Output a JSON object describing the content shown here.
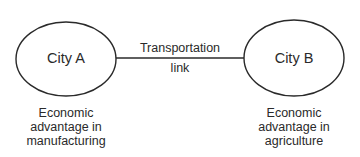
{
  "diagram": {
    "nodes": [
      {
        "id": "city-a",
        "label": "City A",
        "caption": [
          "Economic",
          "advantage in",
          "manufacturing"
        ]
      },
      {
        "id": "city-b",
        "label": "City B",
        "caption": [
          "Economic",
          "advantage in",
          "agriculture"
        ]
      }
    ],
    "edge": {
      "from": "city-a",
      "to": "city-b",
      "label": [
        "Transportation",
        "link"
      ]
    },
    "colors": {
      "stroke": "#2a2a2a",
      "background": "#ffffff"
    }
  }
}
